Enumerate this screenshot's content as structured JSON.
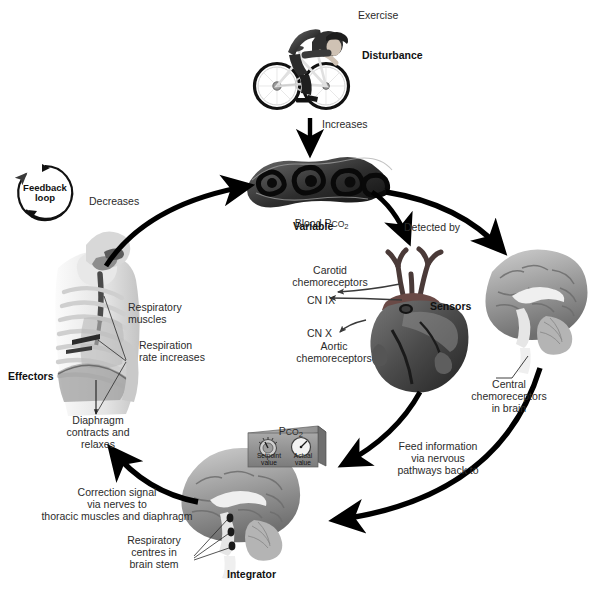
{
  "diagram": {
    "feedback_badge": {
      "line1": "Feedback",
      "line2": "loop"
    }
  },
  "nodes": {
    "disturbance": {
      "image_name": "cyclist-illustration",
      "label": "Exercise",
      "role": "Disturbance"
    },
    "variable": {
      "image_name": "lungs-bronchi-illustration",
      "label_prefix": "Blood P",
      "label_smallcaps": "CO",
      "label_sub": "2",
      "role": "Variable"
    },
    "sensors": {
      "image_name": "heart-great-vessels-illustration",
      "role": "Sensors",
      "annotations": [
        {
          "text": "Carotid\nchemoreceptors"
        },
        {
          "text": "CN IX"
        },
        {
          "text": "CN X"
        },
        {
          "text": "Aortic\nchemoreceptors"
        }
      ]
    },
    "central_sensor": {
      "image_name": "brain-sagittal-illustration",
      "annotation": "Central\nchemoreceptors\nin brain"
    },
    "integrator": {
      "image_name": "brain-sagittal-illustration",
      "role": "Integrator",
      "annotation": "Respiratory\ncentres in\nbrain stem",
      "control_box": {
        "title_prefix": "P",
        "title_smallcaps": "CO",
        "title_sub": "2",
        "dial_label": "Setpoint\nvalue",
        "gauge_label": "Actual\nvalue"
      }
    },
    "effectors": {
      "image_name": "thorax-ribcage-diaphragm-illustration",
      "role": "Effectors",
      "annotations": [
        {
          "text": "Respiratory\nmuscles"
        },
        {
          "text": "Respiration\nrate increases"
        },
        {
          "text": "Diaphragm\ncontracts and\nrelaxes"
        }
      ]
    }
  },
  "arrows": [
    {
      "name": "increases",
      "label": "Increases",
      "from": "disturbance",
      "to": "variable"
    },
    {
      "name": "detected-by",
      "label": "Detected by",
      "from": "variable",
      "to": "sensors"
    },
    {
      "name": "to-central-sensor",
      "label": "",
      "from": "variable",
      "to": "central_sensor"
    },
    {
      "name": "feed-information",
      "label": "Feed information\nvia nervous\npathways back to",
      "from": "sensors",
      "to": "integrator"
    },
    {
      "name": "feed-information-central",
      "label": "",
      "from": "central_sensor",
      "to": "integrator"
    },
    {
      "name": "correction-signal",
      "label": "Correction signal\nvia nerves to\nthoracic muscles and diaphragm",
      "from": "integrator",
      "to": "effectors"
    },
    {
      "name": "decreases",
      "label": "Decreases",
      "from": "effectors",
      "to": "variable"
    }
  ],
  "colors": {
    "background": "#ffffff",
    "ink": "#1a1a1a",
    "arrow": "#000000",
    "label": "#2b2b2b",
    "art_dark": "#3a3a3a",
    "art_mid": "#8d8d8d",
    "art_light": "#d4d4d4"
  }
}
